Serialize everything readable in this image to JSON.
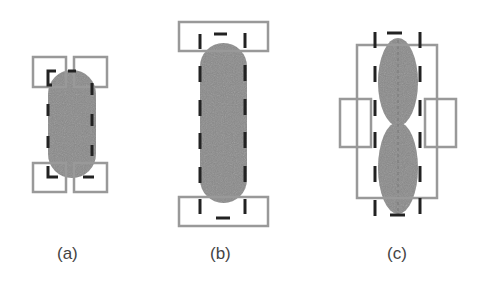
{
  "figure": {
    "panels": [
      {
        "id": "a",
        "label": "(a)",
        "description": "capsule with four square bounding boxes at corners and dashed outline"
      },
      {
        "id": "b",
        "label": "(b)",
        "description": "tall capsule with wide top and bottom boxes and dashed outline"
      },
      {
        "id": "c",
        "label": "(c)",
        "description": "two stacked ellipses inside a rectangle with side boxes and dashed outline"
      }
    ]
  },
  "colors": {
    "fill": "#8a8a8a",
    "box_stroke": "#999999",
    "dash_stroke": "#222222",
    "background": "#ffffff"
  }
}
